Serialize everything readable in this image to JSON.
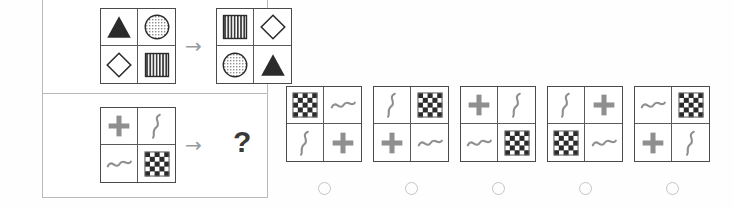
{
  "puzzle": {
    "type": "visual-analogy-matrix-reasoning",
    "arrow_glyph": "→",
    "question_glyph": "?",
    "colors": {
      "panel_border": "#b9b9b9",
      "matrix_border": "#4a4a4a",
      "cell_divider": "#5a5a5a",
      "shape_dark": "#2b2b2b",
      "shape_gray": "#8f8f8f",
      "arrow": "#9a9a9a",
      "radio": "#c4c4c4",
      "background": "#fefefe"
    },
    "example_row": {
      "label": "example",
      "source_matrix": {
        "name": "example-source-matrix",
        "cells": [
          "filled-triangle",
          "dotted-circle",
          "outline-diamond",
          "striped-square"
        ]
      },
      "arrow": "→",
      "target_matrix": {
        "name": "example-target-matrix",
        "cells": [
          "striped-square",
          "outline-diamond",
          "dotted-circle",
          "filled-triangle"
        ]
      }
    },
    "problem_row": {
      "label": "problem",
      "source_matrix": {
        "name": "problem-source-matrix",
        "cells": [
          "plus",
          "squiggle",
          "tilde",
          "checkerboard"
        ]
      },
      "arrow": "→",
      "answer_placeholder": "?"
    },
    "options": [
      {
        "id": "A",
        "name": "option-1",
        "cells": [
          "checkerboard",
          "tilde",
          "squiggle",
          "plus"
        ]
      },
      {
        "id": "B",
        "name": "option-2",
        "cells": [
          "squiggle",
          "checkerboard",
          "plus",
          "tilde"
        ]
      },
      {
        "id": "C",
        "name": "option-3",
        "cells": [
          "plus",
          "squiggle",
          "tilde",
          "checkerboard"
        ]
      },
      {
        "id": "D",
        "name": "option-4",
        "cells": [
          "squiggle",
          "plus",
          "checkerboard",
          "tilde"
        ]
      },
      {
        "id": "E",
        "name": "option-5",
        "cells": [
          "tilde",
          "checkerboard",
          "plus",
          "squiggle"
        ]
      }
    ],
    "option_positions_x": [
      286,
      373,
      460,
      547,
      634
    ],
    "radio_positions_x": [
      318,
      405,
      492,
      579,
      666
    ]
  }
}
